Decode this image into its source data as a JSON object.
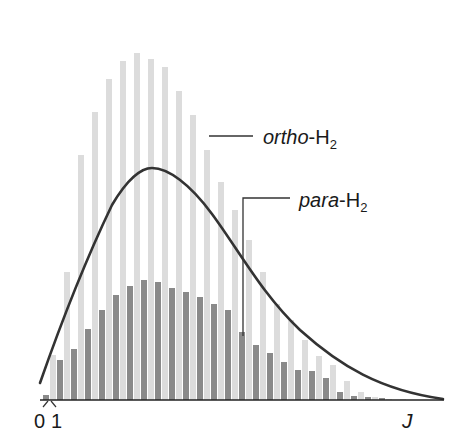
{
  "chart_data": {
    "type": "bar",
    "title": "",
    "xlabel": "J",
    "ylabel": "",
    "grid": false,
    "legend_position": "inline-annotations",
    "x_tick_labels": [
      "0",
      "1"
    ],
    "series": [
      {
        "name": "ortho-H2",
        "label_italic": "ortho",
        "label_rest": "-H",
        "label_sub": "2",
        "color": "#dcdcdc",
        "x": [
          1,
          3,
          5,
          7,
          9,
          11,
          13,
          15,
          17,
          19,
          21,
          23,
          25,
          27,
          29,
          31,
          33,
          35,
          37,
          39,
          41,
          43,
          45,
          47,
          49,
          51,
          53,
          55,
          57
        ],
        "values": [
          45,
          128,
          245,
          288,
          321,
          339,
          347,
          341,
          333,
          309,
          285,
          250,
          218,
          190,
          160,
          128,
          96,
          80,
          60,
          44,
          35,
          19,
          8,
          3,
          1,
          1,
          0,
          0,
          0
        ]
      },
      {
        "name": "para-H2",
        "label_italic": "para",
        "label_rest": "-H",
        "label_sub": "2",
        "color": "#8a8a8a",
        "x": [
          0,
          2,
          4,
          6,
          8,
          10,
          12,
          14,
          16,
          18,
          20,
          22,
          24,
          26,
          28,
          30,
          32,
          34,
          36,
          38,
          40,
          42,
          44,
          46,
          48,
          50
        ],
        "values": [
          5,
          40,
          51,
          71,
          90,
          105,
          114,
          120,
          118,
          112,
          108,
          103,
          96,
          90,
          68,
          55,
          47,
          38,
          30,
          29,
          22,
          8,
          4,
          3,
          2,
          0
        ]
      }
    ],
    "curve": {
      "name": "thermal distribution envelope",
      "color": "#333333",
      "peak_x_px": 152,
      "peak_y_px": 168
    }
  },
  "labels": {
    "ortho_italic": "ortho",
    "ortho_rest": "-H",
    "ortho_sub": "2",
    "para_italic": "para",
    "para_rest": "-H",
    "para_sub": "2",
    "tick_0": "0",
    "tick_1": "1",
    "x_axis": "J"
  }
}
